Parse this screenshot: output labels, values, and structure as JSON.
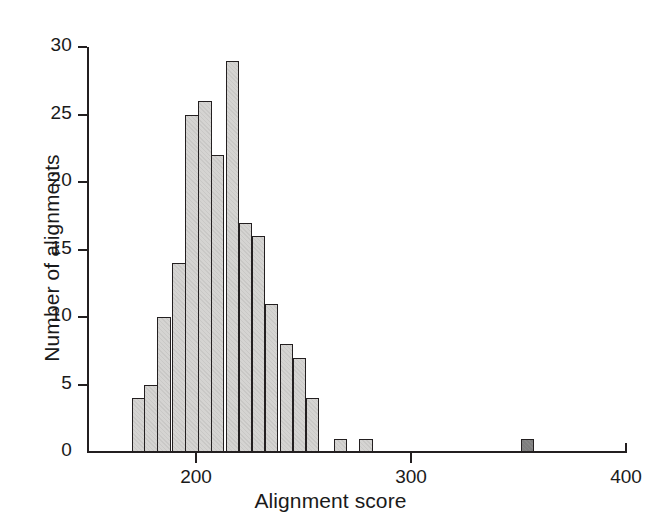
{
  "chart_data": {
    "type": "bar",
    "title": "",
    "subtitle": "",
    "xlabel": "Alignment score",
    "ylabel": "Number of alignments",
    "xlim": [
      149,
      400
    ],
    "ylim": [
      0,
      30
    ],
    "grid": false,
    "legend": null,
    "bin_width": 6.25,
    "xticks": [
      200,
      300,
      400
    ],
    "xtick_labels": [
      "200",
      "300",
      "400"
    ],
    "yticks": [
      0,
      5,
      10,
      15,
      20,
      25,
      30
    ],
    "ytick_labels": [
      "0",
      "5",
      "10",
      "15",
      "20",
      "25",
      "30"
    ],
    "categories": [
      "170",
      "176",
      "182",
      "189",
      "195",
      "201",
      "207",
      "214",
      "220",
      "226",
      "232",
      "239",
      "245",
      "251",
      "257",
      "264",
      "270",
      "276",
      "282",
      "289",
      "295",
      "301",
      "307",
      "314",
      "320",
      "326",
      "332",
      "339",
      "345",
      "351",
      "357",
      "364",
      "370",
      "376",
      "382",
      "389",
      "395"
    ],
    "values": [
      4,
      5,
      10,
      14,
      25,
      26,
      22,
      29,
      17,
      16,
      11,
      8,
      7,
      4,
      0,
      1,
      0,
      1,
      0,
      0,
      0,
      0,
      0,
      0,
      0,
      0,
      0,
      0,
      0,
      1,
      0,
      0,
      0,
      0,
      0,
      0,
      0
    ],
    "bar_colors": [
      "#d5d4d2",
      "#d5d4d2",
      "#d5d4d2",
      "#d5d4d2",
      "#d5d4d2",
      "#d5d4d2",
      "#d5d4d2",
      "#d5d4d2",
      "#d5d4d2",
      "#d5d4d2",
      "#d5d4d2",
      "#d5d4d2",
      "#d5d4d2",
      "#d5d4d2",
      "#d5d4d2",
      "#d5d4d2",
      "#d5d4d2",
      "#d5d4d2",
      "#d5d4d2",
      "#d5d4d2",
      "#d5d4d2",
      "#d5d4d2",
      "#d5d4d2",
      "#d5d4d2",
      "#d5d4d2",
      "#d5d4d2",
      "#d5d4d2",
      "#d5d4d2",
      "#d5d4d2",
      "#7e7e7e",
      "#d5d4d2",
      "#d5d4d2",
      "#d5d4d2",
      "#d5d4d2",
      "#d5d4d2",
      "#d5d4d2",
      "#d5d4d2"
    ],
    "highlighted_bin": {
      "index": 29,
      "score": 351,
      "count": 1,
      "color": "#7e7e7e"
    },
    "axis_color": "#231f20",
    "background_color": "#ffffff"
  }
}
